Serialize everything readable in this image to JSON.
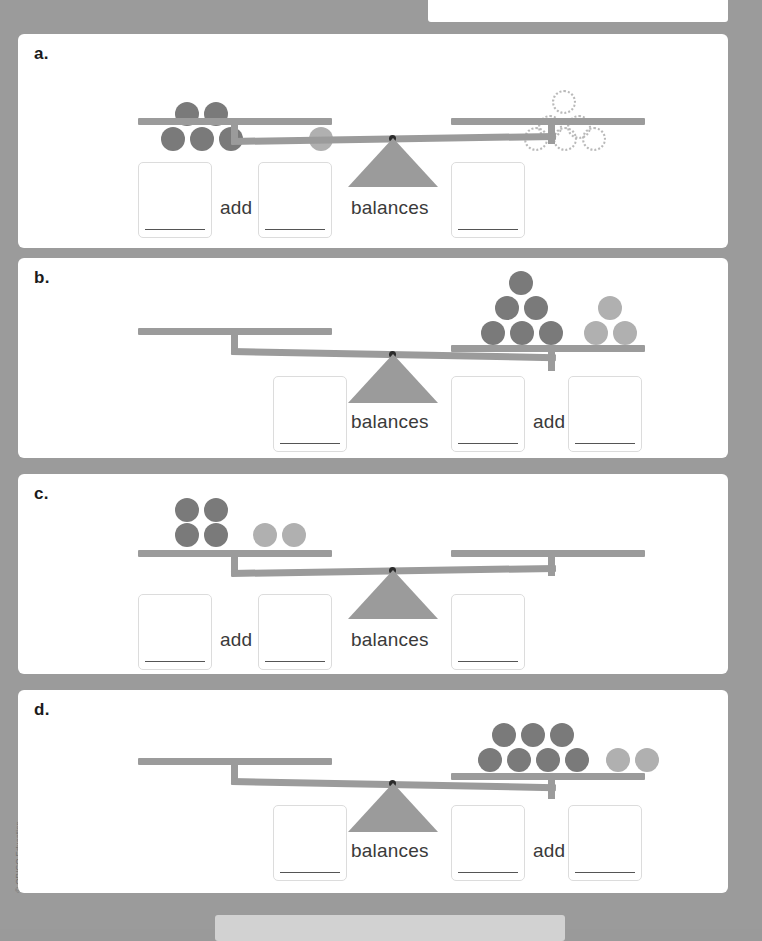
{
  "worksheet": {
    "copyright": "© ORIGO Education",
    "counter_colors": {
      "dark": "#7a7a7a",
      "light": "#b0b0b0",
      "outline": "#b9b9b9",
      "apparatus": "#9b9b9b",
      "page_background": "#9b9b9b"
    },
    "labels": {
      "add": "add",
      "balances": "balances"
    },
    "panels": [
      {
        "id": "a",
        "letter": "a.",
        "tilt": "left-down",
        "left_pan": {
          "dark_counters": 5,
          "light_counters": 1,
          "outline_counters": 0,
          "dark_rows": [
            2,
            3
          ],
          "light_rows": [
            1
          ]
        },
        "right_pan": {
          "dark_counters": 0,
          "light_counters": 0,
          "outline_counters": 6,
          "outline_rows": [
            1,
            2,
            3
          ]
        },
        "boxes": [
          {
            "name": "box-1",
            "value": "",
            "side": "left"
          },
          {
            "name": "box-2",
            "value": "",
            "side": "left"
          },
          {
            "name": "box-3",
            "value": "",
            "side": "right"
          }
        ],
        "operators": [
          {
            "name": "add",
            "text": "add",
            "after_box": 1
          },
          {
            "name": "balances",
            "text": "balances",
            "after_box": 2
          }
        ]
      },
      {
        "id": "b",
        "letter": "b.",
        "tilt": "right-down",
        "left_pan": {
          "dark_counters": 0,
          "light_counters": 0,
          "outline_counters": 0
        },
        "right_pan": {
          "dark_counters": 6,
          "light_counters": 3,
          "outline_counters": 0,
          "dark_rows": [
            1,
            2,
            3
          ],
          "light_rows": [
            1,
            2
          ]
        },
        "boxes": [
          {
            "name": "box-1",
            "value": "",
            "side": "left"
          },
          {
            "name": "box-2",
            "value": "",
            "side": "right"
          },
          {
            "name": "box-3",
            "value": "",
            "side": "right"
          }
        ],
        "operators": [
          {
            "name": "balances",
            "text": "balances",
            "after_box": 1
          },
          {
            "name": "add",
            "text": "add",
            "after_box": 2
          }
        ]
      },
      {
        "id": "c",
        "letter": "c.",
        "tilt": "left-down",
        "left_pan": {
          "dark_counters": 4,
          "light_counters": 2,
          "outline_counters": 0,
          "dark_rows": [
            2,
            2
          ],
          "light_rows": [
            2
          ]
        },
        "right_pan": {
          "dark_counters": 0,
          "light_counters": 0,
          "outline_counters": 0
        },
        "boxes": [
          {
            "name": "box-1",
            "value": "",
            "side": "left"
          },
          {
            "name": "box-2",
            "value": "",
            "side": "left"
          },
          {
            "name": "box-3",
            "value": "",
            "side": "right"
          }
        ],
        "operators": [
          {
            "name": "add",
            "text": "add",
            "after_box": 1
          },
          {
            "name": "balances",
            "text": "balances",
            "after_box": 2
          }
        ]
      },
      {
        "id": "d",
        "letter": "d.",
        "tilt": "right-down",
        "left_pan": {
          "dark_counters": 0,
          "light_counters": 0,
          "outline_counters": 0
        },
        "right_pan": {
          "dark_counters": 7,
          "light_counters": 2,
          "outline_counters": 0,
          "dark_rows": [
            3,
            4
          ],
          "light_rows": [
            2
          ]
        },
        "boxes": [
          {
            "name": "box-1",
            "value": "",
            "side": "left"
          },
          {
            "name": "box-2",
            "value": "",
            "side": "right"
          },
          {
            "name": "box-3",
            "value": "",
            "side": "right"
          }
        ],
        "operators": [
          {
            "name": "balances",
            "text": "balances",
            "after_box": 1
          },
          {
            "name": "add",
            "text": "add",
            "after_box": 2
          }
        ]
      }
    ]
  }
}
